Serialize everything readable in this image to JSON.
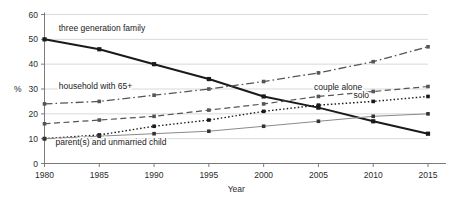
{
  "chart_data": {
    "type": "line",
    "title": "",
    "xlabel": "Year",
    "ylabel": "%",
    "categories": [
      1980,
      1985,
      1990,
      1995,
      2000,
      2005,
      2010,
      2015
    ],
    "x_tick_labels": [
      "1980",
      "1985",
      "1990",
      "1995",
      "2000",
      "2005",
      "2010",
      "2015"
    ],
    "y_tick_labels": [
      "0",
      "10",
      "20",
      "30",
      "40",
      "50",
      "60"
    ],
    "y_ticks": [
      0,
      10,
      20,
      30,
      40,
      50,
      60
    ],
    "ylim": [
      0,
      60
    ],
    "xlim": [
      1980,
      2015
    ],
    "grid": true,
    "grid_axis": "y",
    "legend": "inline-labels",
    "series": [
      {
        "name": "three generation family",
        "label": "three generation family",
        "style": "solid-thick",
        "color": "#1a1a1a",
        "marker": "square",
        "values": [
          50,
          46,
          40,
          34,
          27,
          22.5,
          17,
          12
        ],
        "label_x": 1981.3,
        "label_y": 53.5
      },
      {
        "name": "household with 65+",
        "label": "household with 65+",
        "style": "dash-dot",
        "color": "#555555",
        "marker": "square",
        "values": [
          24,
          25,
          27.5,
          30,
          33,
          36.5,
          41,
          47
        ],
        "label_x": 1981.3,
        "label_y": 29.8
      },
      {
        "name": "couple alone",
        "label": "couple alone",
        "style": "dashed",
        "color": "#555555",
        "marker": "square",
        "values": [
          16,
          17.5,
          19,
          21.5,
          24,
          27,
          29,
          31
        ],
        "label_x": 2004.6,
        "label_y": 29.6
      },
      {
        "name": "solo",
        "label": "solo",
        "style": "dotted",
        "color": "#1a1a1a",
        "marker": "square",
        "values": [
          10,
          11.5,
          15,
          17.5,
          21,
          23.5,
          25,
          27
        ],
        "label_x": 2008.2,
        "label_y": 26.2
      },
      {
        "name": "parent(s) and unmarried child",
        "label": "parent(s) and unmarried child",
        "style": "solid-thin",
        "color": "#8a8a8a",
        "marker": "square",
        "values": [
          10,
          11,
          12,
          13,
          15,
          17,
          19,
          20
        ],
        "label_x": 1981.0,
        "label_y": 7.6
      }
    ],
    "colors": {
      "gridline": "#c8c8c8",
      "axis": "#6e6e6e",
      "text": "#2b2b2b",
      "background": "#ffffff"
    }
  }
}
